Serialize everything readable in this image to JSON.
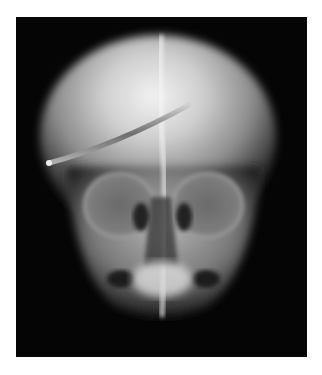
{
  "image": {
    "subject": "skull-xray-frontal-view",
    "description": "Frontal radiograph of a skull with a linear metallic rod traversing the cranium",
    "colors": {
      "border": "#ffffff",
      "background": "#050505",
      "bone": "#d8d8d8",
      "highlight": "#f4f4f4",
      "rod": "#8a8a8a"
    }
  }
}
